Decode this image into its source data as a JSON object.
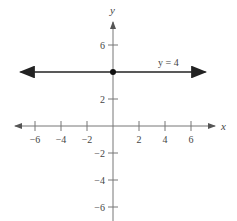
{
  "chart_data": {
    "type": "line",
    "title": "",
    "xlabel": "x",
    "ylabel": "y",
    "xlim": [
      -7,
      7
    ],
    "ylim": [
      -7,
      7
    ],
    "x_ticks": [
      -6,
      -4,
      -2,
      2,
      4,
      6
    ],
    "y_ticks": [
      6,
      2,
      -2,
      -4,
      -6
    ],
    "x_tick_labels": [
      "−6",
      "−4",
      "−2",
      "2",
      "4",
      "6"
    ],
    "y_tick_labels": [
      "6",
      "2",
      "−2",
      "−4",
      "−6"
    ],
    "grid": false,
    "series": [
      {
        "name": "y = 4",
        "equation": "y = 4",
        "x": [
          -6.5,
          6.5
        ],
        "y": [
          4,
          4
        ],
        "arrows_both_ends": true
      }
    ],
    "points": [
      {
        "x": 0,
        "y": 4,
        "label": "y-intercept"
      }
    ],
    "annotations": [
      {
        "text": "y = 4",
        "x": 3.0,
        "y": 4.6
      }
    ]
  },
  "colors": {
    "axis": "#666666",
    "line": "#222222",
    "text": "#444444"
  }
}
